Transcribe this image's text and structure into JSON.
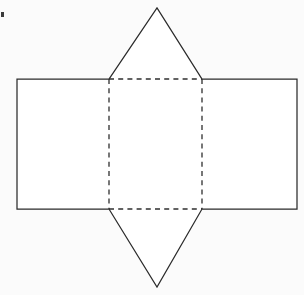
{
  "figure": {
    "canvas": {
      "width": 304,
      "height": 295
    },
    "colors": {
      "background": "#ffffff",
      "solid_stroke": "#2b2b2b",
      "dashed_stroke": "#2f2f2f",
      "face_fill": "#ffffff",
      "speck": "#3a3a3a"
    },
    "stroke": {
      "solid_width": 1.25,
      "dashed_width": 1.3,
      "dash_pattern": "5 4.2"
    }
  },
  "geometry": {
    "key_points": {
      "rect_left_top_left": [
        17,
        79
      ],
      "rect_left_bottom_left": [
        17,
        209
      ],
      "fold_left_top": [
        109,
        79
      ],
      "fold_left_bottom": [
        109,
        209
      ],
      "fold_right_top": [
        202,
        79
      ],
      "fold_right_bottom": [
        202,
        209
      ],
      "rect_right_top_right": [
        297,
        79
      ],
      "rect_right_bottom_right": [
        297,
        209
      ],
      "triangle_top_apex": [
        157,
        8
      ],
      "triangle_bottom_apex": [
        157,
        287
      ]
    },
    "faces": [
      {
        "name": "left-rectangle",
        "shape": "rectangle",
        "points": [
          [
            17,
            79
          ],
          [
            109,
            79
          ],
          [
            109,
            209
          ],
          [
            17,
            209
          ]
        ],
        "width": 92,
        "height": 130
      },
      {
        "name": "middle-rectangle",
        "shape": "rectangle",
        "points": [
          [
            109,
            79
          ],
          [
            202,
            79
          ],
          [
            202,
            209
          ],
          [
            109,
            209
          ]
        ],
        "width": 93,
        "height": 130
      },
      {
        "name": "right-rectangle",
        "shape": "rectangle",
        "points": [
          [
            202,
            79
          ],
          [
            297,
            79
          ],
          [
            297,
            209
          ],
          [
            202,
            209
          ]
        ],
        "width": 95,
        "height": 130
      },
      {
        "name": "top-triangle",
        "shape": "triangle",
        "points": [
          [
            109,
            79
          ],
          [
            157,
            8
          ],
          [
            202,
            79
          ]
        ],
        "base": 93,
        "height": 71
      },
      {
        "name": "bottom-triangle",
        "shape": "triangle",
        "points": [
          [
            109,
            209
          ],
          [
            157,
            287
          ],
          [
            202,
            209
          ]
        ],
        "base": 93,
        "height": 78
      }
    ],
    "solid_outline_path": "M 17 79 L 109 79 L 157 8 L 202 79 L 297 79 L 297 209 L 202 209 L 157 287 L 109 209 L 17 209 Z",
    "dashed_fold_lines": [
      {
        "name": "fold-top-horizontal",
        "from": [
          109,
          79
        ],
        "to": [
          202,
          79
        ],
        "orientation": "horizontal"
      },
      {
        "name": "fold-bottom-horizontal",
        "from": [
          109,
          209
        ],
        "to": [
          202,
          209
        ],
        "orientation": "horizontal"
      },
      {
        "name": "fold-left-vertical",
        "from": [
          109,
          79
        ],
        "to": [
          109,
          209
        ],
        "orientation": "vertical"
      },
      {
        "name": "fold-right-vertical",
        "from": [
          202,
          79
        ],
        "to": [
          202,
          209
        ],
        "orientation": "vertical"
      }
    ],
    "artifacts": [
      {
        "name": "scan-speck",
        "x": 1,
        "y": 12,
        "width": 3,
        "height": 5
      }
    ]
  },
  "labels": {
    "visible_text": []
  }
}
